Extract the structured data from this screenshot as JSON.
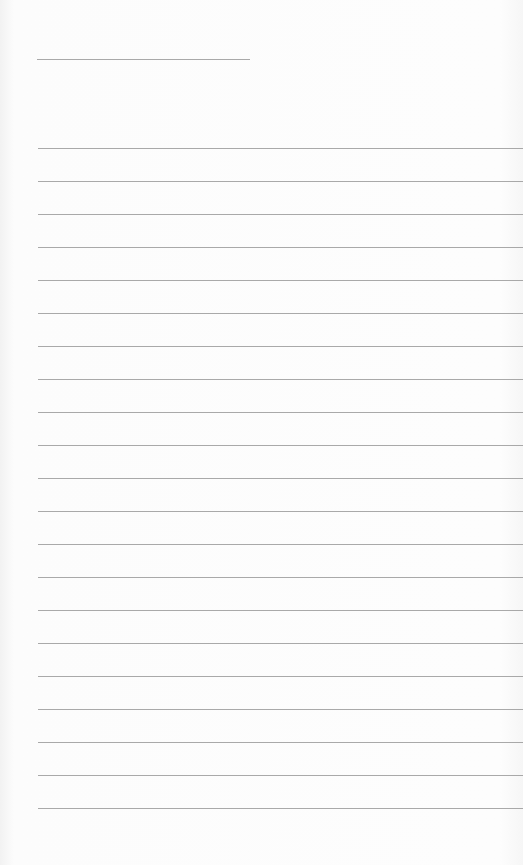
{
  "page": {
    "type": "lined-paper",
    "colors": {
      "paper": "#fcfcfc",
      "line": "#9a9a9a"
    },
    "title_line": {
      "top": 59,
      "left": 37,
      "width": 213
    },
    "rules": {
      "count": 21,
      "first_top": 148,
      "spacing": 33,
      "left": 38
    }
  }
}
